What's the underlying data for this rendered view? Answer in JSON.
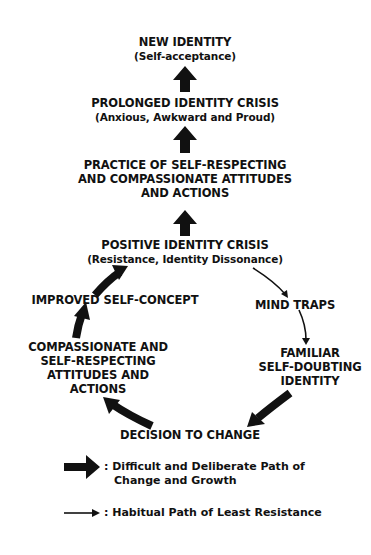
{
  "diagram": {
    "nodes": {
      "new_identity": {
        "title": "NEW IDENTITY",
        "subtitle": "(Self-acceptance)"
      },
      "prolonged_crisis": {
        "title": "PROLONGED IDENTITY CRISIS",
        "subtitle": "(Anxious, Awkward and Proud)"
      },
      "practice": {
        "lines": [
          "PRACTICE OF SELF-RESPECTING",
          "AND COMPASSIONATE ATTITUDES",
          "AND ACTIONS"
        ]
      },
      "positive_crisis": {
        "title": "POSITIVE IDENTITY CRISIS",
        "subtitle": "(Resistance, Identity Dissonance)"
      },
      "improved_self_concept": {
        "title": "IMPROVED SELF-CONCEPT"
      },
      "mind_traps": {
        "title": "MIND TRAPS"
      },
      "compassionate": {
        "lines": [
          "COMPASSIONATE AND",
          "SELF-RESPECTING",
          "ATTITUDES AND",
          "ACTIONS"
        ]
      },
      "familiar": {
        "lines": [
          "FAMILIAR",
          "SELF-DOUBTING",
          "IDENTITY"
        ]
      },
      "decision": {
        "title": "DECISION TO CHANGE"
      }
    },
    "edges": [
      {
        "from": "prolonged_crisis",
        "to": "new_identity",
        "type": "thick"
      },
      {
        "from": "practice",
        "to": "prolonged_crisis",
        "type": "thick"
      },
      {
        "from": "positive_crisis",
        "to": "practice",
        "type": "thick"
      },
      {
        "from": "improved_self_concept",
        "to": "positive_crisis",
        "type": "thick"
      },
      {
        "from": "compassionate",
        "to": "improved_self_concept",
        "type": "thick"
      },
      {
        "from": "decision",
        "to": "compassionate",
        "type": "thick"
      },
      {
        "from": "familiar",
        "to": "decision",
        "type": "thick"
      },
      {
        "from": "positive_crisis",
        "to": "mind_traps",
        "type": "thin"
      },
      {
        "from": "mind_traps",
        "to": "familiar",
        "type": "thin"
      }
    ]
  },
  "legend": {
    "thick": {
      "lines": [
        ": Difficult and Deliberate Path of",
        "Change and Growth"
      ]
    },
    "thin": {
      "lines": [
        ": Habitual Path of Least Resistance"
      ]
    }
  },
  "colors": {
    "ink": "#111111",
    "background": "#ffffff"
  }
}
